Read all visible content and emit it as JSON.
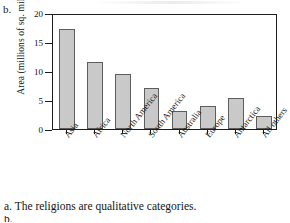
{
  "figure": {
    "part_label": "b.",
    "caption": "a. The religions are qualitative categories.",
    "caption_stub": "b."
  },
  "chart_data": {
    "type": "bar",
    "title": "",
    "xlabel": "",
    "ylabel": "Area (millions of sq. miles)",
    "categories": [
      "Asia",
      "Africa",
      "North America",
      "South America",
      "Australia",
      "Europe",
      "Antarctica",
      "All others"
    ],
    "values": [
      17.2,
      11.6,
      9.4,
      7.0,
      3.1,
      4.0,
      5.4,
      2.3
    ],
    "ylim": [
      0,
      20
    ],
    "yticks": [
      0,
      5,
      10,
      15,
      20
    ],
    "ytick_labels": [
      "0",
      "5",
      "10",
      "15",
      "20"
    ],
    "grid": false,
    "legend": false,
    "bar_fill_color": "#c9c9c9",
    "bar_edge_color": "#5d5d5d",
    "axis_color": "#1d1d1d"
  }
}
